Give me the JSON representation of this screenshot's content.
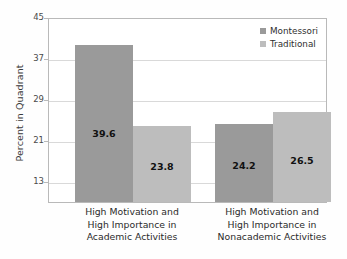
{
  "chart_data": {
    "type": "bar",
    "title": "",
    "xlabel": "",
    "ylabel": "Percent in Quadrant",
    "categories": [
      "High Motivation and High Importance in Academic Activities",
      "High Motivation and High Importance in Nonacademic Activities"
    ],
    "category_lines": [
      [
        "High Motivation and",
        "High Importance in",
        "Academic Activities"
      ],
      [
        "High Motivation and",
        "High Importance in",
        "Nonacademic Activities"
      ]
    ],
    "series": [
      {
        "name": "Montessori",
        "values": [
          39.6,
          24.2
        ],
        "color": "#9a9a9a"
      },
      {
        "name": "Traditional",
        "values": [
          23.8,
          26.5
        ],
        "color": "#bdbdbd"
      }
    ],
    "ylim": [
      9,
      45
    ],
    "yticks": [
      45,
      37,
      29,
      21,
      13
    ],
    "ytick_labels": [
      "45",
      "37",
      "29",
      "21",
      "13"
    ],
    "grid": true,
    "legend_position": "top-right",
    "value_labels": [
      "39.6",
      "23.8",
      "24.2",
      "26.5"
    ]
  },
  "legend": {
    "items": [
      {
        "label": "Montessori"
      },
      {
        "label": "Traditional"
      }
    ]
  },
  "axis": {
    "y_title": "Percent in Quadrant"
  }
}
